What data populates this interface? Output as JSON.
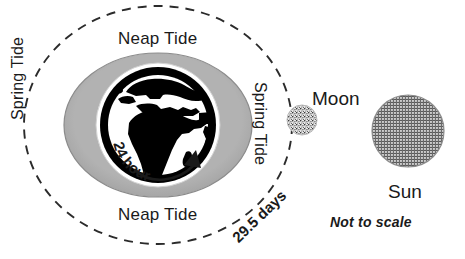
{
  "diagram": {
    "labels": {
      "neap_top": "Neap Tide",
      "neap_bottom": "Neap Tide",
      "spring_left": "Spring Tide",
      "spring_right": "Spring Tide",
      "rotation_period": "24 hours",
      "orbit_period": "29.5 days",
      "moon": "Moon",
      "sun": "Sun",
      "footnote": "Not to scale"
    },
    "colors": {
      "background": "#ffffff",
      "text": "#1a1a1a",
      "earth_ocean": "#ffffff",
      "earth_land": "#000000",
      "earth_ring": "#000000",
      "tidal_bulge": "#a8a8a8",
      "bulge_edge": "#8f8f8f",
      "orbit_dash": "#2b2b2b",
      "moon_fill": "#cfcfcf",
      "sun_fill": "#9a9a9a"
    },
    "geometry": {
      "earth_center_x": 158,
      "earth_center_y": 125,
      "earth_radius": 62,
      "bulge_rx": 94,
      "bulge_ry": 72,
      "orbit_rx": 134,
      "orbit_ry": 119,
      "moon_center_x": 302,
      "moon_center_y": 120,
      "moon_radius": 15,
      "sun_center_x": 408,
      "sun_center_y": 131,
      "sun_radius": 36
    },
    "icons": {
      "rotation_arrow": "curved-arrow-icon",
      "orbit": "dashed-ellipse-icon",
      "earth": "earth-globe-icon",
      "moon": "moon-circle-icon",
      "sun": "sun-circle-icon"
    }
  }
}
